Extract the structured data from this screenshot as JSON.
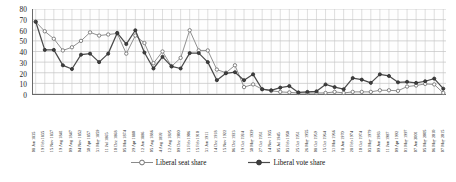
{
  "chart_data": {
    "type": "line",
    "title": "",
    "subtitle": "",
    "xlabel": "",
    "ylabel": "",
    "ylim": [
      0,
      80
    ],
    "yticks": [
      0,
      10,
      20,
      30,
      40,
      50,
      60,
      70,
      80
    ],
    "grid": true,
    "legend_position": "bottom-center",
    "categories": [
      "08 Jan 1835",
      "19 Feb 1835",
      "15 Nov 1837",
      "19 Aug 1841",
      "09 Aug 1847",
      "04 Nov 1852",
      "30 Apr 1857",
      "31 May 1859",
      "11 Jul 1865",
      "10 Dec 1868",
      "05 Mar 1874",
      "29 Apr 1880",
      "12 Jan 1886",
      "05 Aug 1886",
      "4 Aug 1892",
      "12 Aug 1895",
      "09 Dec 1900",
      "13 Feb 1906",
      "15 Feb 1910",
      "31 Jan 1911",
      "14 Dec 1918",
      "15 Nov 1922",
      "06 Dec 1923",
      "19 Oct 1924",
      "30 May 1929",
      "27 Oct 1931",
      "14 Nov 1935",
      "05 Jul 1945",
      "03 Feb 1950",
      "25 Oct 1951",
      "26 May 1955",
      "08 Oct 1959",
      "15 Oct 1964",
      "31 Mar 1966",
      "18 Jun 1970",
      "28 Feb 1974",
      "10 Oct 1974",
      "03 May 1979",
      "09 Jun 1983",
      "11 Jun 1987",
      "09 Apr 1992",
      "01 May 1997",
      "07 Jun 2001",
      "05 May 2005",
      "06 May 2010",
      "07 May 2015"
    ],
    "series": [
      {
        "name": "Liberal seat share",
        "marker": "open-circle",
        "color": "#8a8a8a",
        "values": [
          68,
          59,
          52,
          41,
          44,
          50,
          58,
          55,
          56,
          57,
          38,
          55,
          48,
          29,
          40,
          26,
          34,
          60,
          41,
          41,
          23,
          20,
          27,
          6.5,
          9,
          4.5,
          3,
          2,
          1.5,
          1,
          1,
          1,
          1,
          2,
          1,
          2,
          2,
          2,
          3.5,
          3.5,
          3,
          7,
          8,
          9.5,
          9,
          1
        ]
      },
      {
        "name": "Liberal vote share",
        "marker": "filled-circle",
        "color": "#4b4b4b",
        "values": [
          68,
          41.5,
          41.5,
          27,
          23.5,
          37,
          38,
          30,
          38,
          57.5,
          47,
          60,
          39,
          24,
          35,
          26,
          24,
          38.5,
          38.5,
          30,
          13,
          19.5,
          20.5,
          13,
          18.5,
          4.5,
          3.5,
          6,
          7.5,
          1.5,
          2,
          2.5,
          9,
          6.5,
          4.5,
          15,
          13.5,
          10.5,
          18.5,
          17,
          11,
          11.5,
          10.5,
          12,
          14.5,
          5
        ]
      }
    ]
  },
  "legend": {
    "entries": [
      {
        "label": "Liberal seat share"
      },
      {
        "label": "Liberal vote share"
      }
    ]
  }
}
